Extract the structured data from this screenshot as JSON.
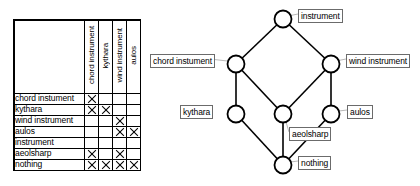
{
  "cross_table": {
    "column_headers": [
      "chord instrument",
      "kythara",
      "wind instrument",
      "aulos"
    ],
    "rows": [
      {
        "label": "chord instument",
        "marks": [
          1,
          0,
          0,
          0
        ]
      },
      {
        "label": "kythara",
        "marks": [
          1,
          1,
          0,
          0
        ]
      },
      {
        "label": "wind instrument",
        "marks": [
          0,
          0,
          1,
          0
        ]
      },
      {
        "label": "aulos",
        "marks": [
          0,
          0,
          1,
          1
        ]
      },
      {
        "label": "instrument",
        "marks": [
          0,
          0,
          0,
          0
        ]
      },
      {
        "label": "aeolsharp",
        "marks": [
          1,
          0,
          1,
          0
        ]
      },
      {
        "label": "nothing",
        "marks": [
          1,
          1,
          1,
          1
        ]
      }
    ],
    "mark_glyph": "X"
  },
  "lattice": {
    "nodes": [
      {
        "id": "instrument",
        "label": "instrument",
        "cx": 133,
        "cy": 19,
        "label_x": 148,
        "label_y": 9,
        "anchor": "right"
      },
      {
        "id": "chord-instument",
        "label": "chord instument",
        "cx": 86,
        "cy": 64,
        "label_x": 0,
        "label_y": 54,
        "anchor": "left"
      },
      {
        "id": "wind-instrument",
        "label": "wind instrument",
        "cx": 181,
        "cy": 64,
        "label_x": 196,
        "label_y": 54,
        "anchor": "right"
      },
      {
        "id": "kythara",
        "label": "kythara",
        "cx": 86,
        "cy": 114,
        "label_x": 30,
        "label_y": 105,
        "anchor": "left"
      },
      {
        "id": "aeolsharp",
        "label": "aeolsharp",
        "cx": 133,
        "cy": 114,
        "label_x": 139,
        "label_y": 127,
        "anchor": "right"
      },
      {
        "id": "aulos",
        "label": "aulos",
        "cx": 181,
        "cy": 114,
        "label_x": 197,
        "label_y": 105,
        "anchor": "right"
      },
      {
        "id": "nothing",
        "label": "nothing",
        "cx": 133,
        "cy": 165,
        "label_x": 148,
        "label_y": 156,
        "anchor": "right"
      }
    ],
    "edges": [
      {
        "from": "chord-instument",
        "to": "instrument"
      },
      {
        "from": "wind-instrument",
        "to": "instrument"
      },
      {
        "from": "kythara",
        "to": "chord-instument"
      },
      {
        "from": "aeolsharp",
        "to": "chord-instument"
      },
      {
        "from": "aeolsharp",
        "to": "wind-instrument"
      },
      {
        "from": "aulos",
        "to": "wind-instrument"
      },
      {
        "from": "nothing",
        "to": "kythara"
      },
      {
        "from": "nothing",
        "to": "aeolsharp"
      },
      {
        "from": "nothing",
        "to": "aulos"
      }
    ],
    "node_radius": 8.5,
    "node_fill": "#ffffff",
    "node_stroke": "#000000",
    "edge_stroke": "#000000"
  }
}
